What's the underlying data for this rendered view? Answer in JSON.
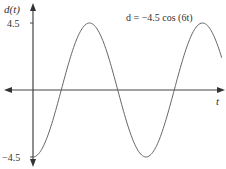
{
  "chart_data": {
    "type": "line",
    "title": "",
    "annotation": "d = −4.5 cos (6t)",
    "xlabel": "t",
    "ylabel": "d(t)",
    "yticks": [
      "4.5",
      "−4.5"
    ],
    "ylim": [
      -4.5,
      4.5
    ],
    "grid": false,
    "legend": null,
    "series": [
      {
        "name": "d = -4.5 cos (6t)",
        "function": "-4.5*cos(6t)",
        "amplitude": 4.5,
        "angular_frequency": 6,
        "t_range_periods": [
          0,
          1.67
        ],
        "x": [
          0,
          0.131,
          0.262,
          0.393,
          0.524,
          0.654,
          0.785,
          0.916,
          1.047,
          1.178,
          1.309,
          1.44
        ],
        "values": [
          -4.5,
          0,
          4.5,
          0,
          -4.5,
          0,
          4.5,
          0,
          -4.5,
          0,
          4.5,
          0
        ]
      }
    ],
    "color": "#555555"
  },
  "labels": {
    "y_axis": "d(t)",
    "x_axis": "t",
    "y_top": "4.5",
    "y_bottom": "−4.5",
    "equation": "d = −4.5 cos (6t)"
  }
}
